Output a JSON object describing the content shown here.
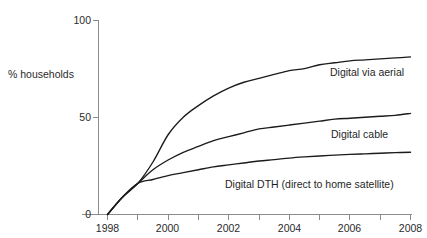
{
  "chart_data": {
    "type": "line",
    "title": "",
    "xlabel": "",
    "ylabel": "% households",
    "xlim": [
      1997.4,
      2008
    ],
    "ylim": [
      0,
      100
    ],
    "grid": false,
    "legend_position": "inline-right",
    "x_ticks": [
      1998,
      1999,
      2000,
      2001,
      2002,
      2003,
      2004,
      2005,
      2006,
      2007,
      2008
    ],
    "x_tick_labels": [
      "1998",
      "",
      "2000",
      "",
      "2002",
      "",
      "2004",
      "",
      "2006",
      "",
      "2008"
    ],
    "y_ticks": [
      0,
      50,
      100
    ],
    "y_tick_labels": [
      "0",
      "50",
      "100"
    ],
    "x": [
      1998,
      1998.5,
      1999,
      1999.5,
      2000,
      2000.5,
      2001,
      2001.5,
      2002,
      2002.5,
      2003,
      2003.5,
      2004,
      2004.5,
      2005,
      2005.5,
      2006,
      2006.5,
      2007,
      2007.5,
      2008
    ],
    "series": [
      {
        "name": "Digital via aerial",
        "label": "Digital via aerial",
        "color": "#1b1b1b",
        "values": [
          0,
          9,
          16,
          27,
          41,
          50,
          56,
          61,
          65,
          68,
          70,
          72,
          74,
          75,
          77,
          78,
          79,
          79.5,
          80,
          80.5,
          81
        ]
      },
      {
        "name": "Digital cable",
        "label": "Digital cable",
        "color": "#1b1b1b",
        "values": [
          0,
          9,
          16,
          23,
          28,
          32,
          35,
          38,
          40,
          42,
          44,
          45,
          46,
          47,
          48,
          49,
          49.5,
          50,
          50.5,
          51,
          52
        ]
      },
      {
        "name": "Digital DTH (direct to home satellite)",
        "label": "Digital DTH (direct to home satellite)",
        "color": "#1b1b1b",
        "values": [
          0,
          9,
          16,
          18,
          20,
          21.5,
          23,
          24.5,
          25.5,
          26.5,
          27.5,
          28.2,
          29,
          29.6,
          30.1,
          30.5,
          30.9,
          31.2,
          31.5,
          31.8,
          32
        ]
      }
    ]
  },
  "axis": {
    "y_label": "% households",
    "y_tick_100": "100",
    "y_tick_50": "50",
    "y_tick_0": "0",
    "x_tick_1998": "1998",
    "x_tick_2000": "2000",
    "x_tick_2002": "2002",
    "x_tick_2004": "2004",
    "x_tick_2006": "2006",
    "x_tick_2008": "2008"
  },
  "series_labels": {
    "aerial": "Digital via aerial",
    "cable": "Digital cable",
    "dth": "Digital DTH (direct to home satellite)"
  }
}
